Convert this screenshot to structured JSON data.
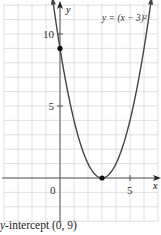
{
  "chart_data": {
    "type": "line",
    "title": "",
    "equation_label": "y = (x − 3)²",
    "xlabel": "x",
    "ylabel": "y",
    "xlim": [
      -4,
      7
    ],
    "ylim": [
      -3,
      12
    ],
    "grid": true,
    "x_ticks": [
      {
        "value": 0,
        "label": "0"
      },
      {
        "value": 5,
        "label": "5"
      }
    ],
    "y_ticks": [
      {
        "value": 5,
        "label": "5"
      },
      {
        "value": 10,
        "label": "10"
      }
    ],
    "series": [
      {
        "name": "y = (x − 3)²",
        "function": "(x-3)^2",
        "x": [
          -0.4,
          0,
          1,
          2,
          3,
          4,
          5,
          6,
          6.4
        ],
        "y": [
          11.56,
          9,
          4,
          1,
          0,
          1,
          4,
          9,
          11.56
        ]
      }
    ],
    "points": [
      {
        "x": 0,
        "y": 9,
        "label": "y-intercept (0, 9)"
      },
      {
        "x": 3,
        "y": 0,
        "label": "vertex (3, 0)"
      }
    ],
    "annotations": [
      "y-intercept (0, 9)"
    ]
  },
  "caption": {
    "italic_part": "y",
    "rest": "-intercept (0, 9)"
  },
  "colors": {
    "grid": "#d8d8d8",
    "axis": "#555555",
    "curve": "#444444",
    "point": "#111111",
    "text": "#333333"
  }
}
